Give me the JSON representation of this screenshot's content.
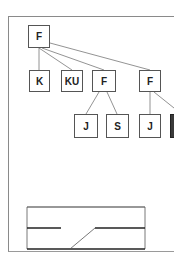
{
  "diagram": {
    "type": "tree",
    "nodes": [
      {
        "id": "root",
        "label": "F",
        "x": 28,
        "y": 25,
        "w": 22,
        "h": 23
      },
      {
        "id": "k",
        "label": "K",
        "x": 29,
        "y": 70,
        "w": 21,
        "h": 22
      },
      {
        "id": "ku",
        "label": "KU",
        "x": 61,
        "y": 70,
        "w": 22,
        "h": 22
      },
      {
        "id": "f1",
        "label": "F",
        "x": 92,
        "y": 70,
        "w": 24,
        "h": 22
      },
      {
        "id": "f2",
        "label": "F",
        "x": 139,
        "y": 70,
        "w": 22,
        "h": 22
      },
      {
        "id": "j1",
        "label": "J",
        "x": 74,
        "y": 114,
        "w": 24,
        "h": 24
      },
      {
        "id": "s",
        "label": "S",
        "x": 106,
        "y": 114,
        "w": 23,
        "h": 24
      },
      {
        "id": "j2",
        "label": "J",
        "x": 139,
        "y": 114,
        "w": 22,
        "h": 24
      },
      {
        "id": "cut",
        "label": "",
        "x": 170,
        "y": 114,
        "w": 10,
        "h": 24
      }
    ],
    "edges": [
      [
        "root",
        "k"
      ],
      [
        "root",
        "ku"
      ],
      [
        "root",
        "f1"
      ],
      [
        "root",
        "f2"
      ],
      [
        "f1",
        "j1"
      ],
      [
        "f1",
        "s"
      ],
      [
        "f2",
        "j2"
      ],
      [
        "f2",
        "cut"
      ]
    ],
    "inset": {
      "label": "switch-line schematic",
      "x": 27,
      "y": 207,
      "w": 118,
      "h": 42
    }
  }
}
